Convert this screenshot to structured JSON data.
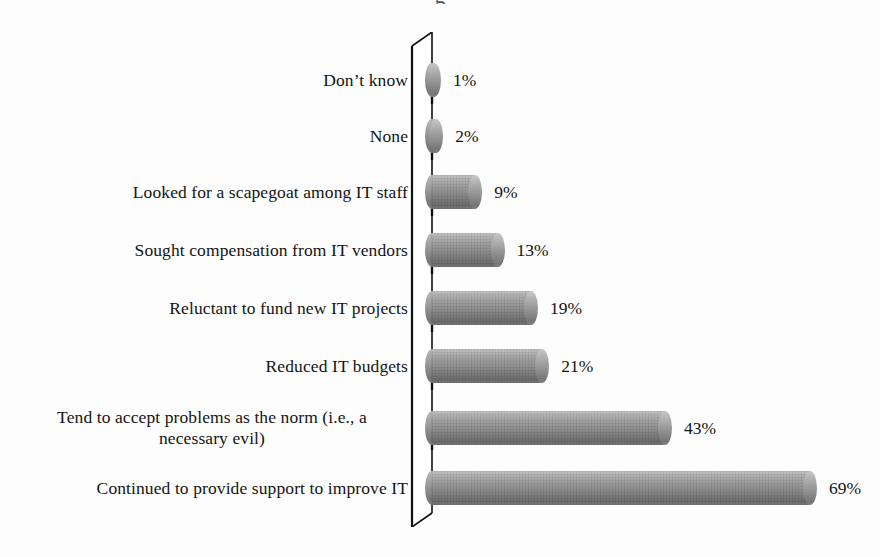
{
  "title_clipped": "g",
  "axis": {
    "origin_x": 432,
    "depth_offset_x": 20,
    "top_y": 32,
    "bottom_y": 527,
    "line_color": "#1a1a1a",
    "wall_fill": "#ffffff"
  },
  "style": {
    "bar_color_top": "#c3c3c3",
    "bar_color_bottom": "#6c6c6c",
    "text_color": "#141414",
    "background": "#fdfdfd",
    "px_per_percent": 5.58,
    "bar_height_px": 34,
    "row_height_px": 56
  },
  "chart_data": {
    "type": "bar",
    "orientation": "horizontal",
    "title": "",
    "xlabel": "",
    "ylabel": "",
    "grid": false,
    "legend": false,
    "xlim": [
      0,
      75
    ],
    "value_suffix": "%",
    "categories": [
      "Don’t know",
      "None",
      "Looked for a scapegoat among IT staff",
      "Sought compensation from IT vendors",
      "Reluctant to fund new IT projects",
      "Reduced IT budgets",
      "Tend to accept problems as the norm (i.e., a necessary evil)",
      "Continued to provide support to improve IT"
    ],
    "values": [
      1,
      2,
      9,
      13,
      19,
      21,
      43,
      69
    ],
    "value_labels": [
      "1%",
      "2%",
      "9%",
      "13%",
      "19%",
      "21%",
      "43%",
      "69%"
    ]
  },
  "rows": [
    {
      "label_lines": [
        "Don’t know"
      ],
      "value": 1,
      "value_label": "1%",
      "top": 20
    },
    {
      "label_lines": [
        "None"
      ],
      "value": 2,
      "value_label": "2%",
      "top": 76
    },
    {
      "label_lines": [
        "Looked for a scapegoat among IT staff"
      ],
      "value": 9,
      "value_label": "9%",
      "top": 132
    },
    {
      "label_lines": [
        "Sought compensation from IT vendors"
      ],
      "value": 13,
      "value_label": "13%",
      "top": 190
    },
    {
      "label_lines": [
        "Reluctant to fund new IT projects"
      ],
      "value": 19,
      "value_label": "19%",
      "top": 248
    },
    {
      "label_lines": [
        "Reduced IT budgets"
      ],
      "value": 21,
      "value_label": "21%",
      "top": 306
    },
    {
      "label_lines": [
        "Tend to accept problems as the norm (i.e., a",
        "necessary evil)"
      ],
      "value": 43,
      "value_label": "43%",
      "top": 368
    },
    {
      "label_lines": [
        "Continued to provide support to improve IT"
      ],
      "value": 69,
      "value_label": "69%",
      "top": 428
    }
  ]
}
